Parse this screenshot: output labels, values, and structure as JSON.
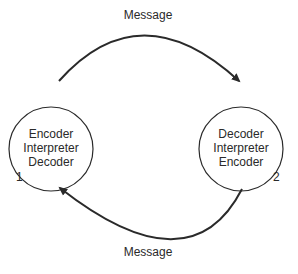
{
  "diagram": {
    "top_arrow_label": "Message",
    "bottom_arrow_label": "Message",
    "nodes": [
      {
        "id": "1",
        "number": "1",
        "lines": [
          "Encoder",
          "Interpreter",
          "Decoder"
        ]
      },
      {
        "id": "2",
        "number": "2",
        "lines": [
          "Decoder",
          "Interpreter",
          "Encoder"
        ]
      }
    ],
    "edges": [
      {
        "from": "1",
        "to": "2",
        "label": "Message"
      },
      {
        "from": "2",
        "to": "1",
        "label": "Message"
      }
    ],
    "colors": {
      "stroke": "#2a2a2a",
      "background": "#ffffff"
    }
  }
}
